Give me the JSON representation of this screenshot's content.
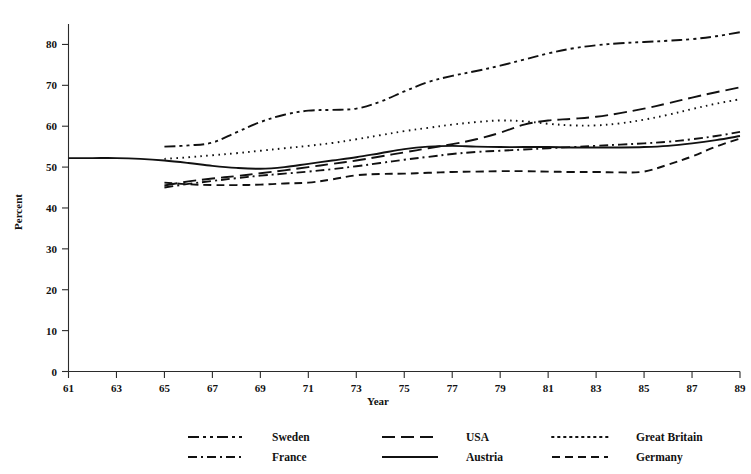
{
  "chart_data": {
    "type": "line",
    "title": "",
    "xlabel": "Year",
    "ylabel": "Percent",
    "xlim": [
      61,
      89
    ],
    "ylim": [
      0,
      85
    ],
    "grid": false,
    "legend_position": "bottom",
    "xticks": [
      61,
      63,
      65,
      67,
      69,
      71,
      73,
      75,
      77,
      79,
      81,
      83,
      85,
      87,
      89
    ],
    "xtick_labels": [
      "61",
      "63",
      "65",
      "67",
      "69",
      "71",
      "73",
      "75",
      "77",
      "79",
      "81",
      "83",
      "85",
      "87",
      "89"
    ],
    "yticks": [
      0,
      10,
      20,
      30,
      40,
      50,
      60,
      70,
      80
    ],
    "ytick_labels": [
      "0",
      "10",
      "20",
      "30",
      "40",
      "50",
      "60",
      "70",
      "80"
    ],
    "series": [
      {
        "name": "Sweden",
        "style": "dash-dot-dot",
        "dasharray": "11,4,3,4,3,4",
        "x": [
          65,
          66,
          67,
          68,
          69,
          70,
          71,
          72,
          73,
          74,
          75,
          76,
          77,
          78,
          79,
          80,
          81,
          82,
          83,
          84,
          85,
          86,
          87,
          88,
          89
        ],
        "values": [
          55.0,
          55.3,
          56.0,
          58.5,
          61.0,
          62.8,
          63.8,
          64.0,
          64.3,
          66.0,
          68.5,
          70.8,
          72.3,
          73.5,
          74.8,
          76.3,
          77.8,
          79.0,
          79.8,
          80.3,
          80.6,
          80.9,
          81.3,
          82.0,
          83.0
        ]
      },
      {
        "name": "USA",
        "style": "long-dash",
        "dasharray": "13,6",
        "x": [
          65,
          66,
          67,
          68,
          69,
          70,
          71,
          72,
          73,
          74,
          75,
          76,
          77,
          78,
          79,
          80,
          81,
          82,
          83,
          84,
          85,
          86,
          87,
          88,
          89
        ],
        "values": [
          45.5,
          46.5,
          47.2,
          47.8,
          48.5,
          49.2,
          50.0,
          50.8,
          51.6,
          52.6,
          53.6,
          54.6,
          55.6,
          56.8,
          58.4,
          60.4,
          61.4,
          61.8,
          62.3,
          63.2,
          64.3,
          65.6,
          67.0,
          68.3,
          69.5
        ]
      },
      {
        "name": "Great Britain",
        "style": "dotted",
        "dasharray": "1.6,4.4",
        "x": [
          65,
          66,
          67,
          68,
          69,
          70,
          71,
          72,
          73,
          74,
          75,
          76,
          77,
          78,
          79,
          80,
          81,
          82,
          83,
          84,
          85,
          86,
          87,
          88,
          89
        ],
        "values": [
          52.0,
          52.4,
          52.9,
          53.4,
          54.0,
          54.6,
          55.2,
          55.9,
          56.8,
          57.8,
          58.8,
          59.6,
          60.4,
          61.0,
          61.4,
          61.2,
          60.6,
          60.2,
          60.2,
          60.7,
          61.6,
          62.8,
          64.2,
          65.5,
          66.6
        ]
      },
      {
        "name": "France",
        "style": "dash-dot",
        "dasharray": "9,4,2,4",
        "x": [
          65,
          66,
          67,
          68,
          69,
          70,
          71,
          72,
          73,
          74,
          75,
          76,
          77,
          78,
          79,
          80,
          81,
          82,
          83,
          84,
          85,
          86,
          87,
          88,
          89
        ],
        "values": [
          45.0,
          45.9,
          46.6,
          47.3,
          47.9,
          48.4,
          48.9,
          49.5,
          50.2,
          51.0,
          51.8,
          52.5,
          53.2,
          53.7,
          54.0,
          54.3,
          54.6,
          54.9,
          55.2,
          55.5,
          55.8,
          56.2,
          56.8,
          57.6,
          58.6
        ]
      },
      {
        "name": "Austria",
        "style": "solid",
        "dasharray": "0",
        "x": [
          61,
          62,
          63,
          64,
          65,
          66,
          67,
          68,
          69,
          70,
          71,
          72,
          73,
          74,
          75,
          76,
          77,
          78,
          79,
          80,
          81,
          82,
          83,
          84,
          85,
          86,
          87,
          88,
          89
        ],
        "values": [
          52.2,
          52.2,
          52.2,
          52.0,
          51.6,
          51.0,
          50.3,
          49.8,
          49.6,
          50.0,
          50.8,
          51.6,
          52.4,
          53.4,
          54.4,
          55.0,
          55.2,
          55.0,
          54.9,
          54.9,
          54.9,
          54.8,
          54.8,
          54.8,
          54.9,
          55.2,
          55.8,
          56.6,
          57.6
        ]
      },
      {
        "name": "Germany",
        "style": "dashed",
        "dasharray": "8,5",
        "x": [
          65,
          66,
          67,
          68,
          69,
          70,
          71,
          72,
          73,
          74,
          75,
          76,
          77,
          78,
          79,
          80,
          81,
          82,
          83,
          84,
          85,
          86,
          87,
          88,
          89
        ],
        "values": [
          46.2,
          45.8,
          45.6,
          45.6,
          45.7,
          46.0,
          46.2,
          47.0,
          48.0,
          48.3,
          48.4,
          48.6,
          48.8,
          48.9,
          49.0,
          49.0,
          48.9,
          48.8,
          48.8,
          48.7,
          48.9,
          50.6,
          52.6,
          55.0,
          57.0
        ]
      }
    ],
    "legend": [
      {
        "label": "Sweden",
        "style": "dash-dot-dot",
        "dasharray": "11,4,3,4,3,4"
      },
      {
        "label": "USA",
        "style": "long-dash",
        "dasharray": "13,6"
      },
      {
        "label": "Great Britain",
        "style": "dotted",
        "dasharray": "1.6,4.4"
      },
      {
        "label": "France",
        "style": "dash-dot",
        "dasharray": "9,4,2,4"
      },
      {
        "label": "Austria",
        "style": "solid",
        "dasharray": "0"
      },
      {
        "label": "Germany",
        "style": "dashed",
        "dasharray": "8,5"
      }
    ]
  }
}
